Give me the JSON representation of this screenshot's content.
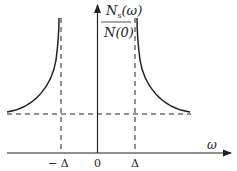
{
  "diagram": {
    "y_label_numerator": "N",
    "y_label_numerator_sub": "s",
    "y_label_numerator_arg": "(ω)",
    "y_label_denominator": "N(0)",
    "x_label": "ω",
    "ticks": {
      "neg": "− Δ",
      "zero": "0",
      "pos": "Δ"
    },
    "colors": {
      "stroke": "#222222",
      "background": "#ffffff"
    }
  }
}
